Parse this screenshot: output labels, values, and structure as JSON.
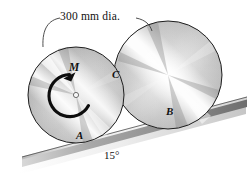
{
  "figure": {
    "background_color": "#ffffff",
    "dimension_label": "300 mm dia.",
    "angle_label": "15°",
    "moment_label": "M",
    "points": {
      "a": "A",
      "b": "B",
      "c": "C"
    },
    "colors": {
      "outline": "#1a1a1a",
      "disk_light": "#ffffff",
      "disk_mid": "#c9c9c9",
      "disk_dark": "#8e8e8e",
      "incline_top": "#f2f2f2",
      "incline_face": "#9a9a9a",
      "incline_edge": "#6f6f6f",
      "leader": "#3a3a3a",
      "hub": "#f6f6f6"
    },
    "geometry": {
      "incline_angle_deg": 15,
      "small_disk": {
        "cx": 76,
        "cy": 95,
        "r": 48
      },
      "large_disk": {
        "cx": 168,
        "cy": 75,
        "r": 54
      },
      "hub": {
        "cx": 76,
        "cy": 95,
        "r": 2.6
      }
    }
  }
}
